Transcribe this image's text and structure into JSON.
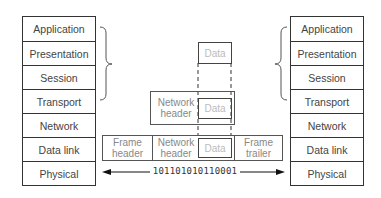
{
  "left_stack": {
    "layers": [
      "Application",
      "Presentation",
      "Session",
      "Transport",
      "Network",
      "Data link",
      "Physical"
    ]
  },
  "right_stack": {
    "layers": [
      "Application",
      "Presentation",
      "Session",
      "Transport",
      "Network",
      "Data link",
      "Physical"
    ]
  },
  "encapsulation": {
    "upper_data": "Data",
    "network_packet": {
      "header": "Network\nheader",
      "data": "Data"
    },
    "frame": {
      "header": "Frame\nheader",
      "network_header": "Network\nheader",
      "data": "Data",
      "trailer": "Frame\ntrailer"
    }
  },
  "bitstream": "101101010110001",
  "colors": {
    "line": "#333333",
    "text": "#444444",
    "faded_text": "#bbbbbb"
  }
}
